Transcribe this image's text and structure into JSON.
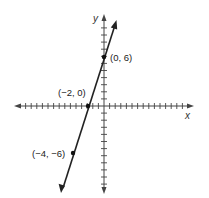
{
  "chart_data": {
    "type": "line",
    "title": "",
    "xlabel": "x",
    "ylabel": "y",
    "grid": false,
    "legend": null,
    "xlim": [
      -11,
      11
    ],
    "ylim": [
      -11,
      11
    ],
    "series": [
      {
        "name": "line through labeled points",
        "equation": "y = 3x + 6",
        "points": [
          {
            "x": -4,
            "y": -6,
            "label": "(−4, −6)"
          },
          {
            "x": -2,
            "y": 0,
            "label": "(−2, 0)"
          },
          {
            "x": 0,
            "y": 6,
            "label": "(0, 6)"
          }
        ]
      }
    ]
  },
  "labels": {
    "x_axis": "x",
    "y_axis": "y",
    "p1": "(0, 6)",
    "p2": "(−2, 0)",
    "p3": "(−4, −6)"
  },
  "colors": {
    "axis": "#444444",
    "line": "#222222",
    "point": "#111111"
  }
}
